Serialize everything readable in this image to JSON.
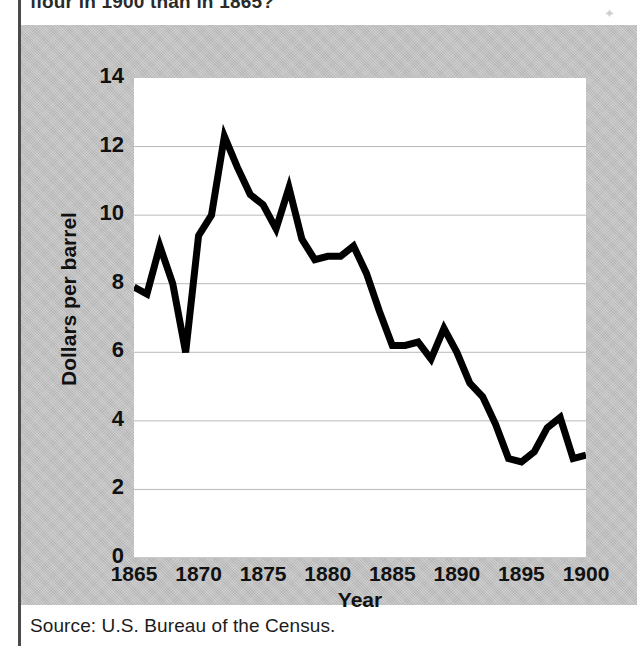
{
  "page": {
    "question_text": "flour in 1900 than in 1865?",
    "corner_mark": "✦",
    "source": "Source: U.S. Bureau of the Census."
  },
  "chart_data": {
    "type": "line",
    "title": "",
    "subtitle": "",
    "xlabel": "Year",
    "ylabel": "Dollars per barrel",
    "xlim": [
      1865,
      1900
    ],
    "ylim": [
      0,
      14
    ],
    "yticks": [
      0,
      2,
      4,
      6,
      8,
      10,
      12,
      14
    ],
    "ytick_labels": [
      "0",
      "2",
      "4",
      "6",
      "8",
      "10",
      "12",
      "14"
    ],
    "xticks": [
      1865,
      1870,
      1875,
      1880,
      1885,
      1890,
      1895,
      1900
    ],
    "xtick_labels": [
      "1865",
      "1870",
      "1875",
      "1880",
      "1885",
      "1890",
      "1895",
      "1900"
    ],
    "grid": "horizontal",
    "legend": "none",
    "line_color": "#000000",
    "line_width": 7,
    "plot_background": "#ffffff",
    "panel_background": "#c0c0c0",
    "x": [
      1865,
      1866,
      1867,
      1868,
      1869,
      1870,
      1871,
      1872,
      1873,
      1874,
      1875,
      1876,
      1877,
      1878,
      1879,
      1880,
      1881,
      1882,
      1883,
      1884,
      1885,
      1886,
      1887,
      1888,
      1889,
      1890,
      1891,
      1892,
      1893,
      1894,
      1895,
      1896,
      1897,
      1898,
      1899,
      1900
    ],
    "values": [
      7.9,
      7.7,
      9.1,
      8.0,
      6.0,
      9.4,
      10.0,
      12.3,
      11.4,
      10.6,
      10.3,
      9.6,
      10.8,
      9.3,
      8.7,
      8.8,
      8.8,
      9.1,
      8.3,
      7.2,
      6.2,
      6.2,
      6.3,
      5.8,
      6.7,
      6.0,
      5.1,
      4.7,
      3.9,
      2.9,
      2.8,
      3.1,
      3.8,
      4.1,
      2.9,
      3.0
    ],
    "series": [
      {
        "name": "Wheat flour price",
        "values": [
          7.9,
          7.7,
          9.1,
          8.0,
          6.0,
          9.4,
          10.0,
          12.3,
          11.4,
          10.6,
          10.3,
          9.6,
          10.8,
          9.3,
          8.7,
          8.8,
          8.8,
          9.1,
          8.3,
          7.2,
          6.2,
          6.2,
          6.3,
          5.8,
          6.7,
          6.0,
          5.1,
          4.7,
          3.9,
          2.9,
          2.8,
          3.1,
          3.8,
          4.1,
          2.9,
          3.0
        ]
      }
    ]
  }
}
